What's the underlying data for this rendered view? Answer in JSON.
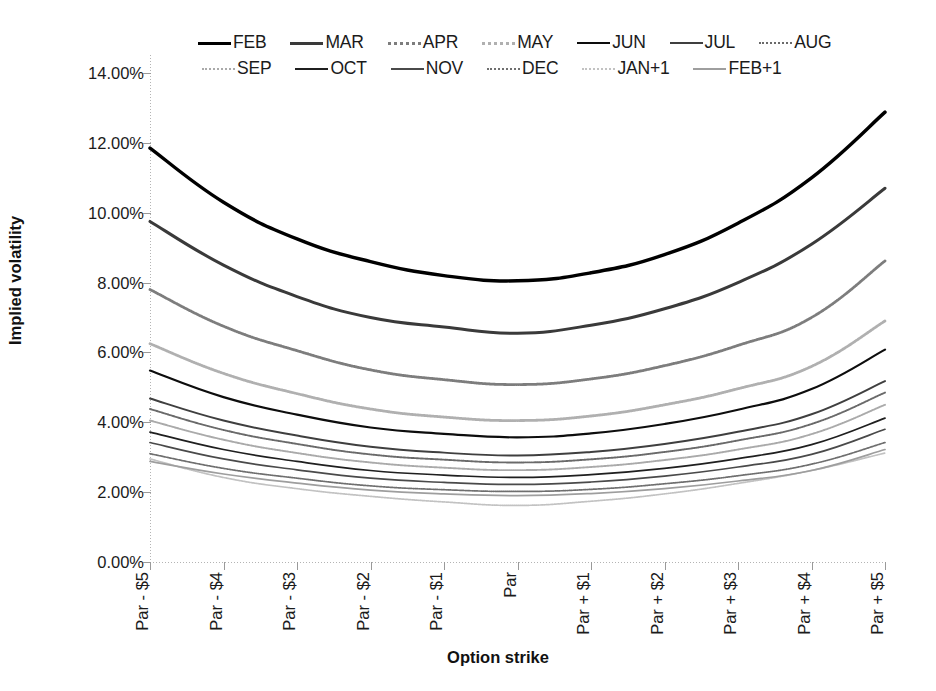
{
  "chart_data": {
    "type": "line",
    "title": "",
    "xlabel": "Option strike",
    "ylabel": "Implied volatility",
    "ylim": [
      0,
      14
    ],
    "ytick_labels": [
      "0.00%",
      "2.00%",
      "4.00%",
      "6.00%",
      "8.00%",
      "10.00%",
      "12.00%",
      "14.00%"
    ],
    "ytick_values": [
      0,
      2,
      4,
      6,
      8,
      10,
      12,
      14
    ],
    "grid": false,
    "legend_position": "top",
    "categories": [
      "Par - $5",
      "Par - $4",
      "Par - $3",
      "Par - $2",
      "Par - $1",
      "Par",
      "Par + $1",
      "Par + $2",
      "Par + $3",
      "Par + $4",
      "Par + $5"
    ],
    "series": [
      {
        "name": "FEB",
        "color": "#000000",
        "width": 3.4,
        "dash": "none",
        "values": [
          11.85,
          10.3,
          9.25,
          8.6,
          8.2,
          8.05,
          8.28,
          8.8,
          9.7,
          11.0,
          12.88
        ]
      },
      {
        "name": "MAR",
        "color": "#3a3a3a",
        "width": 3.0,
        "dash": "none",
        "values": [
          9.75,
          8.5,
          7.6,
          7.0,
          6.73,
          6.55,
          6.78,
          7.25,
          8.0,
          9.1,
          10.7
        ]
      },
      {
        "name": "APR",
        "color": "#7d7d7d",
        "width": 2.8,
        "dash": "1,1",
        "values": [
          7.8,
          6.75,
          6.05,
          5.5,
          5.22,
          5.08,
          5.24,
          5.62,
          6.2,
          7.0,
          8.62
        ]
      },
      {
        "name": "MAY",
        "color": "#b0b0b0",
        "width": 2.8,
        "dash": "1,1",
        "values": [
          6.25,
          5.4,
          4.82,
          4.38,
          4.15,
          4.05,
          4.18,
          4.5,
          4.96,
          5.6,
          6.9
        ]
      },
      {
        "name": "JUN",
        "color": "#0d0d0d",
        "width": 2.2,
        "dash": "none",
        "values": [
          5.48,
          4.72,
          4.22,
          3.85,
          3.67,
          3.57,
          3.68,
          3.95,
          4.36,
          4.95,
          6.08
        ]
      },
      {
        "name": "JUL",
        "color": "#3f3f3f",
        "width": 1.9,
        "dash": "none",
        "values": [
          4.68,
          4.05,
          3.62,
          3.3,
          3.13,
          3.05,
          3.15,
          3.38,
          3.73,
          4.23,
          5.18
        ]
      },
      {
        "name": "AUG",
        "color": "#6a6a6a",
        "width": 1.9,
        "dash": "1,1",
        "values": [
          4.38,
          3.78,
          3.38,
          3.08,
          2.93,
          2.85,
          2.94,
          3.15,
          3.48,
          3.95,
          4.85
        ]
      },
      {
        "name": "SEP",
        "color": "#aaaaaa",
        "width": 1.9,
        "dash": "1,1",
        "values": [
          4.05,
          3.5,
          3.12,
          2.85,
          2.7,
          2.63,
          2.72,
          2.92,
          3.22,
          3.66,
          4.5
        ]
      },
      {
        "name": "OCT",
        "color": "#1f1f1f",
        "width": 1.7,
        "dash": "none",
        "values": [
          3.72,
          3.22,
          2.88,
          2.62,
          2.49,
          2.42,
          2.5,
          2.68,
          2.96,
          3.36,
          4.12
        ]
      },
      {
        "name": "NOV",
        "color": "#4a4a4a",
        "width": 1.7,
        "dash": "none",
        "values": [
          3.42,
          2.95,
          2.64,
          2.4,
          2.28,
          2.22,
          2.29,
          2.46,
          2.72,
          3.08,
          3.8
        ]
      },
      {
        "name": "DEC",
        "color": "#6f6f6f",
        "width": 1.7,
        "dash": "1,1",
        "values": [
          3.1,
          2.68,
          2.4,
          2.18,
          2.07,
          2.02,
          2.08,
          2.24,
          2.47,
          2.8,
          3.42
        ]
      },
      {
        "name": "JAN+1",
        "color": "#c2c2c2",
        "width": 1.7,
        "dash": "1,1",
        "values": [
          2.95,
          2.42,
          2.1,
          1.88,
          1.72,
          1.62,
          1.74,
          1.95,
          2.25,
          2.62,
          3.12
        ]
      },
      {
        "name": "FEB+1",
        "color": "#9e9e9e",
        "width": 1.7,
        "dash": "none",
        "values": [
          2.88,
          2.52,
          2.26,
          2.06,
          1.95,
          1.9,
          1.96,
          2.1,
          2.32,
          2.62,
          3.22
        ]
      }
    ]
  },
  "legend": {
    "row1": [
      "FEB",
      "MAR",
      "APR",
      "MAY",
      "JUN",
      "JUL",
      "AUG"
    ],
    "row2": [
      "SEP",
      "OCT",
      "NOV",
      "DEC",
      "JAN+1",
      "FEB+1"
    ]
  },
  "axes": {
    "y_title": "Implied volatility",
    "x_title": "Option strike"
  }
}
